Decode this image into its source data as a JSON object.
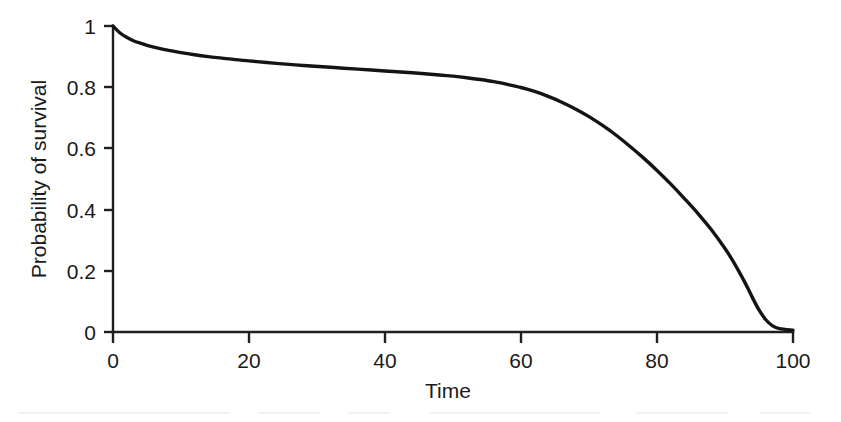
{
  "figure": {
    "background_color": "#ffffff",
    "line_color": "#141414",
    "text_color": "#1a1a1a",
    "axis_color": "#1f1f1f"
  },
  "chart_data": {
    "type": "line",
    "title": "",
    "subtitle": "",
    "xlabel": "Time",
    "ylabel": "Probability of survival",
    "xlim": [
      0,
      100
    ],
    "ylim": [
      0,
      1
    ],
    "xticks": [
      0,
      20,
      40,
      60,
      80,
      100
    ],
    "xtick_labels": [
      "0",
      "20",
      "40",
      "60",
      "80",
      "100"
    ],
    "yticks": [
      0,
      0.2,
      0.4,
      0.6,
      0.8,
      1
    ],
    "ytick_labels": [
      "0",
      "0.2",
      "0.4",
      "0.6",
      "0.8",
      "1"
    ],
    "grid": false,
    "legend": null,
    "legend_position": "none",
    "annotations": [],
    "series": [
      {
        "name": "Probability of survival",
        "color": "#141414",
        "line_width": 3.4,
        "x": [
          0,
          1,
          2,
          3,
          4,
          5,
          6,
          8,
          10,
          12,
          14,
          16,
          18,
          20,
          24,
          28,
          32,
          36,
          40,
          44,
          48,
          50,
          52,
          54,
          56,
          58,
          60,
          62,
          64,
          66,
          68,
          70,
          72,
          74,
          76,
          78,
          80,
          82,
          84,
          86,
          88,
          90,
          91,
          92,
          93,
          94,
          95,
          96,
          97,
          98,
          100
        ],
        "y": [
          1.0,
          0.978,
          0.963,
          0.952,
          0.944,
          0.937,
          0.931,
          0.921,
          0.913,
          0.906,
          0.9,
          0.895,
          0.89,
          0.886,
          0.878,
          0.871,
          0.865,
          0.859,
          0.853,
          0.847,
          0.84,
          0.836,
          0.831,
          0.825,
          0.818,
          0.809,
          0.799,
          0.786,
          0.77,
          0.751,
          0.729,
          0.704,
          0.675,
          0.643,
          0.607,
          0.569,
          0.528,
          0.484,
          0.437,
          0.388,
          0.334,
          0.273,
          0.238,
          0.2,
          0.159,
          0.114,
          0.072,
          0.04,
          0.02,
          0.011,
          0.006
        ]
      }
    ]
  },
  "axis_geometry": {
    "plot_left_px": 113,
    "plot_right_px": 793,
    "plot_top_px": 26,
    "plot_bottom_px": 332
  }
}
